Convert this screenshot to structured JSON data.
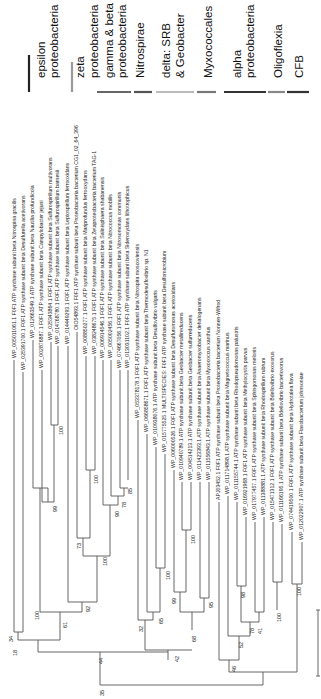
{
  "figure": {
    "type": "phylogenetic tree",
    "orientation": "rotated 90 degrees counter-clockwise",
    "scale_bar": {
      "label": ""
    }
  },
  "clades": [
    {
      "name": "epsilon\nproteobacteria",
      "lines": [
        "epsilon",
        "proteobacteria"
      ],
      "bar_color": "#222222"
    },
    {
      "name": "zeta proteobacteria",
      "lines": [
        "zeta",
        "proteobacteria"
      ],
      "bar_color": "#999999"
    },
    {
      "name": "gamma & beta proteobacteria",
      "lines": [
        "gamma & beta",
        "proteobacteria"
      ],
      "bar_color": "#666666"
    },
    {
      "name": "Nitrospirae",
      "lines": [
        "Nitrospirae"
      ],
      "bar_color": "#555555"
    },
    {
      "name": "delta: SRB & Geobacter",
      "lines": [
        "delta: SRB",
        "& Geobacter"
      ],
      "bar_color": "#bbbbbb"
    },
    {
      "name": "Myxococcales",
      "lines": [
        "Myxococcales"
      ],
      "bar_color": "#777777"
    },
    {
      "name": "alpha proteobacteria",
      "lines": [
        "alpha",
        "proteobacteria"
      ],
      "bar_color": "#333333"
    },
    {
      "name": "Oligoflexia",
      "lines": [
        "Oligoflexia"
      ],
      "bar_color": "#888888"
    },
    {
      "name": "CFB",
      "lines": [
        "CFB"
      ],
      "bar_color": "#333333"
    }
  ],
  "leaves": [
    {
      "id": "WP_005011061.1",
      "label": "WP_005011061.1 F0F1 ATP synthase subunit beta Nitrospina gracilis"
    },
    {
      "id": "WP_025391700.1",
      "label": "WP_025391700.1 F0F1 ATP synthase subunit beta Desulfurella acetivorans"
    },
    {
      "id": "WP_012663549.1",
      "label": "WP_012663549.1 ATP synthase subunit beta Nautilia profundicola"
    },
    {
      "id": "WP_002876887.1",
      "label": "WP_002876887.1 F0F1 ATP synthase subunit beta Campylobacter jejuni"
    },
    {
      "id": "WP_025343864.1",
      "label": "WP_025343864.1 F0F1 ATP synthase subunit beta Sulfurospirillum multivorans"
    },
    {
      "id": "WP_014768780.1",
      "label": "WP_014768780.1 F0F1 ATP synthase subunit beta Sulfurospirillum barnesii"
    },
    {
      "id": "WP_014449293.1",
      "label": "WP_014449293.1 F0F1 ATP synthase subunit beta Leptospirillum ferrooxidans"
    },
    {
      "id": "OIO54893.1",
      "label": "OIO54893.1 F0F1 ATP synthase subunit beta Proteobacteria bacterium CG1_02_64_396"
    },
    {
      "id": "WP_008850277.1",
      "label": "WP_008850277.1 F0F1 ATP synthase subunit beta Mariprofundus ferrooxydans"
    },
    {
      "id": "WP_038248675.1",
      "label": "WP_038248675.1 F0F1 ATP synthase subunit beta Zetaproteobacteria bacterium TAG-1"
    },
    {
      "id": "WP_006914546.1",
      "label": "WP_006914546.1 F0F1 ATP synthase subunit beta Salinisphaera shabanensis"
    },
    {
      "id": "WP_005002456.1",
      "label": "WP_005002456.1 F0F1 ATP synthase subunit beta Nitrococcus mobilis"
    },
    {
      "id": "WP_074667056.1",
      "label": "WP_074667056.1 F0F1 ATP synthase subunit beta Nitrosomonas communis"
    },
    {
      "id": "WP_013031102.1",
      "label": "WP_013031102.1 F0F1 ATP synthase subunit beta Sideroxydans lithotrophicus"
    },
    {
      "id": "WP_053378178.1",
      "label": "WP_053378178.1 F0F1 ATP synthase subunit beta Nitrospira moscoviensis"
    },
    {
      "id": "WP_066858671.1",
      "label": "WP_066858671.1 F0F1 ATP synthase subunit beta Thermodesulfovibrio sp. N1"
    },
    {
      "id": "WP_010938076.1",
      "label": "WP_010938076.1 ATP synthase subunit beta Desulfovibrio vulgaris"
    },
    {
      "id": "WP_015775525.1",
      "label": "WP_015775525.1 MULTISPECIES: F0F1 ATP synthase subunit beta Desulfomicrobium"
    },
    {
      "id": "WP_006000526.1",
      "label": "WP_006000526.1 F0F1 ATP synthase subunit beta Desulfuromonas acetoxidans"
    },
    {
      "id": "WP_010940789.1",
      "label": "WP_010940789.1 ATP synthase subunit beta Geobacter metallireducens"
    },
    {
      "id": "WP_004514213.1",
      "label": "WP_004514213.1 ATP synthase subunit beta Geobacter sulfurreducens"
    },
    {
      "id": "WP_011423393.1",
      "label": "WP_011423393.1 ATP synthase subunit beta Anaeromyxobacter dehalogenans"
    },
    {
      "id": "WP_011556843.1",
      "label": "WP_011556843.1 ATP synthase subunit beta Myxococcus xanthus"
    },
    {
      "id": "APJ03452.1",
      "label": "APJ03452.1 F0F1 ATP synthase subunit beta Proteobacteria bacterium Nonnen-Wifrod"
    },
    {
      "id": "WP_011714898.1",
      "label": "WP_011714898.1 ATP synthase subunit beta Magnetococcus marinus"
    },
    {
      "id": "WP_011155744.1",
      "label": "WP_011155744.1 ATP synthase subunit beta Rhodopseudomonas palustris"
    },
    {
      "id": "WP_016921968.1",
      "label": "WP_016921968.1 F0F1 ATP synthase subunit beta Methylocystis parvus"
    },
    {
      "id": "WP_017977457.1",
      "label": "WP_017977457.1 F0F1 ATP synthase subunit beta Sphingomonas melonis"
    },
    {
      "id": "WP_011388881.1",
      "label": "WP_011388881.1 ATP synthase subunit beta Rhodospirillum rubrum"
    },
    {
      "id": "WP_015471312.1",
      "label": "WP_015471312.1 F0F1 ATP synthase subunit beta Bdellovibrio exovorus"
    },
    {
      "id": "WP_011166195.1",
      "label": "WP_011166195.1 ATP synthase subunit beta Bdellovibrio bacteriovorus"
    },
    {
      "id": "WP_074419500.1",
      "label": "WP_074419500.1 F0F1 ATP synthase subunit beta Hydrotalea flava"
    },
    {
      "id": "WP_012022907.1",
      "label": "WP_012022907.1 ATP synthase subunit beta Flavobacterium johnsoniae"
    }
  ],
  "bootstrap_values": [
    "34",
    "18",
    "100",
    "99",
    "100",
    "61",
    "92",
    "73",
    "100",
    "100",
    "90",
    "78",
    "85",
    "44",
    "32",
    "65",
    "100",
    "42",
    "99",
    "100",
    "68",
    "95",
    "35",
    "46",
    "52",
    "98",
    "78",
    "41",
    "100",
    "100"
  ]
}
